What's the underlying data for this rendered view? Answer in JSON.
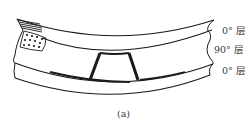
{
  "figure": {
    "caption": "(a)",
    "layers": [
      {
        "label": "0° 层",
        "orientation": "0°",
        "position": "top"
      },
      {
        "label": "90° 层",
        "orientation": "90°",
        "position": "middle"
      },
      {
        "label": "0° 层",
        "orientation": "0°",
        "position": "bottom"
      }
    ],
    "features": [
      {
        "type": "hatching",
        "location": "top-left corner"
      },
      {
        "type": "dotted-fill",
        "location": "left end of top ply"
      },
      {
        "type": "transverse-crack",
        "count": 2,
        "location": "90° layer, center"
      }
    ],
    "colors": {
      "line": "#1a1a1a",
      "text": "#3a3a3a",
      "background": "#ffffff"
    }
  }
}
